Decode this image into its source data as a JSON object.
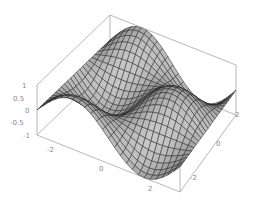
{
  "chart_data": {
    "type": "surface3d",
    "title": "",
    "function": "sin(x) * cos(y)",
    "xlabel": "",
    "ylabel": "",
    "zlabel": "",
    "x_range": [
      -3.14,
      3.14
    ],
    "y_range": [
      -3.14,
      3.14
    ],
    "z_range": [
      -1,
      1
    ],
    "mesh": 24,
    "x_ticks": [
      "-2",
      "0",
      "2"
    ],
    "y_ticks": [
      "-2",
      "0",
      "2"
    ],
    "z_ticks": [
      "1",
      "0.5",
      "0",
      "-0.5",
      "-1"
    ],
    "boxed": true,
    "grid": false,
    "legend": null,
    "colors": {
      "surface_light": "#d8d8d8",
      "surface_dark": "#3a3a3a",
      "mesh_line": "#222222",
      "box": "#9a9a9a",
      "tick_label": "#8a8a8a"
    }
  }
}
